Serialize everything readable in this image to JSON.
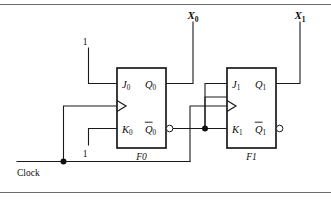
{
  "figure": {
    "kind": "logic-circuit-schematic",
    "background_color": "#ffffff",
    "line_color": "#1a1a1a",
    "rule_color": "#6b6b6b"
  },
  "rules": {
    "top_label": "",
    "bottom_label": ""
  },
  "flipflops": [
    {
      "id": "F0",
      "name": "F0",
      "name_base": "F",
      "name_index": "0",
      "inputs": {
        "j": "J",
        "j_sub": "0",
        "k": "K",
        "k_sub": "0",
        "clock": "clock-triangle"
      },
      "outputs": {
        "q": "Q",
        "q_sub": "0",
        "qbar": "Q",
        "qbar_sub": "0",
        "qbar_has_bubble": true
      }
    },
    {
      "id": "F1",
      "name": "F1",
      "name_base": "F",
      "name_index": "1",
      "inputs": {
        "j": "J",
        "j_sub": "1",
        "k": "K",
        "k_sub": "1",
        "clock": "clock-triangle"
      },
      "outputs": {
        "q": "Q",
        "q_sub": "1",
        "qbar": "Q",
        "qbar_sub": "1",
        "qbar_has_bubble": true
      }
    }
  ],
  "signals": {
    "x0": {
      "base": "X",
      "sub": "0",
      "full": "X0"
    },
    "x1": {
      "base": "X",
      "sub": "1",
      "full": "X1"
    },
    "clock": "Clock",
    "const_high_j0": "1",
    "const_high_k0": "1"
  },
  "connections": [
    {
      "from": "const_high_j0",
      "to": "F0.J0"
    },
    {
      "from": "const_high_k0",
      "to": "F0.K0"
    },
    {
      "from": "Clock",
      "to": "F0.clock"
    },
    {
      "from": "Clock",
      "to": "F1.clock"
    },
    {
      "from": "F0.Q0",
      "to": "X0"
    },
    {
      "from": "F0.Qbar0",
      "to": "F1.J1"
    },
    {
      "from": "F0.Qbar0",
      "to": "F1.K1"
    },
    {
      "from": "F1.Q1",
      "to": "X1"
    }
  ]
}
